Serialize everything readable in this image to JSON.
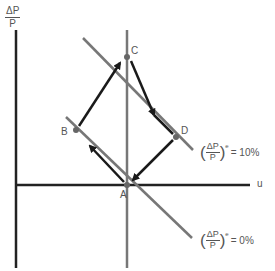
{
  "axes": {
    "y_label": {
      "numerator": "ΔP",
      "denominator": "P"
    },
    "x_label": "u"
  },
  "points": {
    "A": "A",
    "B": "B",
    "C": "C",
    "D": "D"
  },
  "curves": {
    "upper": {
      "lhs_num": "ΔP",
      "lhs_den": "P",
      "sup": "e",
      "rhs": "= 10%"
    },
    "lower": {
      "lhs_num": "ΔP",
      "lhs_den": "P",
      "sup": "e",
      "rhs": "= 0%"
    }
  },
  "colors": {
    "axis": "#222222",
    "curve": "#777777",
    "arrow": "#1a1a1a",
    "point": "#666666"
  }
}
